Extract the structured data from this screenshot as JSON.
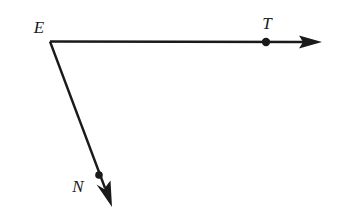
{
  "figure": {
    "background_color": "#ffffff",
    "stroke_color": "#1a1a1a",
    "label_color": "#1a1a1a",
    "width": 342,
    "height": 220
  },
  "labels": {
    "vertex": "E",
    "ray_right_point": "T",
    "ray_down_point": "N"
  },
  "points": {
    "E": {
      "x": 50,
      "y": 41
    },
    "T": {
      "x": 266,
      "y": 42
    },
    "N": {
      "x": 99,
      "y": 175
    }
  },
  "label_positions": {
    "E": {
      "x": 39,
      "y": 27
    },
    "T": {
      "x": 267,
      "y": 23
    },
    "N": {
      "x": 78,
      "y": 186
    }
  },
  "rays": [
    {
      "name": "ray-ET",
      "from": "E",
      "through": "T",
      "start": {
        "x": 50,
        "y": 41
      },
      "end": {
        "x": 322,
        "y": 42
      },
      "arrow_tip": {
        "x": 322,
        "y": 42
      },
      "stroke_width": 2.4
    },
    {
      "name": "ray-EN",
      "from": "E",
      "through": "N",
      "start": {
        "x": 50,
        "y": 41
      },
      "end": {
        "x": 112,
        "y": 207
      },
      "arrow_tip": {
        "x": 112,
        "y": 207
      },
      "stroke_width": 2.4
    }
  ],
  "dots": [
    {
      "name": "point-T-dot",
      "x": 266,
      "y": 42,
      "r": 4.2
    },
    {
      "name": "point-N-dot",
      "x": 99,
      "y": 175,
      "r": 3.8
    }
  ]
}
